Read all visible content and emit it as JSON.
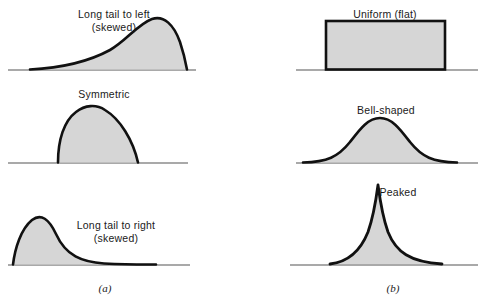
{
  "figure": {
    "background_color": "#ffffff",
    "curve_stroke_color": "#111111",
    "curve_fill_color": "#d6d6d6",
    "axis_color": "#8c8c8c"
  },
  "groups": [
    {
      "id": "a",
      "label": "(a)",
      "x": 105,
      "y": 282
    },
    {
      "id": "b",
      "label": "(b)",
      "x": 393,
      "y": 282
    }
  ],
  "panels": [
    {
      "id": "long-tail-left",
      "label": "Long tail to left\n(skewed)",
      "shape": "left-skewed-curve",
      "column": "a",
      "row": 1,
      "label_x": 114,
      "label_y": 8,
      "baseline": {
        "x1": 8,
        "x2": 196,
        "y": 70
      }
    },
    {
      "id": "symmetric",
      "label": "Symmetric",
      "shape": "symmetric-dome",
      "column": "a",
      "row": 2,
      "label_x": 104,
      "label_y": 88,
      "baseline": {
        "x1": 8,
        "x2": 188,
        "y": 163
      }
    },
    {
      "id": "long-tail-right",
      "label": "Long tail to right\n(skewed)",
      "shape": "right-skewed-curve",
      "column": "a",
      "row": 3,
      "label_x": 116,
      "label_y": 219,
      "baseline": {
        "x1": 8,
        "x2": 190,
        "y": 265
      }
    },
    {
      "id": "uniform-flat",
      "label": "Uniform (flat)",
      "shape": "rectangle",
      "column": "b",
      "row": 1,
      "label_x": 385,
      "label_y": 8,
      "baseline": {
        "x1": 296,
        "x2": 478,
        "y": 70
      }
    },
    {
      "id": "bell-shaped",
      "label": "Bell-shaped",
      "shape": "normal-curve",
      "column": "b",
      "row": 2,
      "label_x": 386,
      "label_y": 104,
      "baseline": {
        "x1": 296,
        "x2": 478,
        "y": 163
      }
    },
    {
      "id": "peaked",
      "label": "Peaked",
      "shape": "peaked-curve",
      "column": "b",
      "row": 3,
      "label_x": 398,
      "label_y": 186,
      "baseline": {
        "x1": 290,
        "x2": 478,
        "y": 265
      }
    }
  ]
}
